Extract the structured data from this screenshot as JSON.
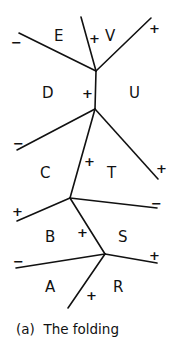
{
  "caption": "(a)  The folding",
  "regions": {
    "A": "A",
    "B": "B",
    "C": "C",
    "D": "D",
    "E": "E",
    "R": "R",
    "S": "S",
    "T": "T",
    "U": "U",
    "V": "V"
  },
  "signs": {
    "s1": "−",
    "s2": "+",
    "s3": "+",
    "s4": "+",
    "s5": "−",
    "s6": "+",
    "s7": "+",
    "s8": "+",
    "s9": "−",
    "s10": "+",
    "s11": "−",
    "s12": "+",
    "s13": "+"
  },
  "line_color": "#111111"
}
